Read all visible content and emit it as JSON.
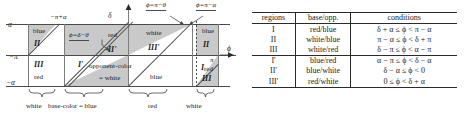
{
  "figure": {
    "type": "diagram-with-table",
    "accent_shade": "#c9c9c9",
    "line_color": "#4a4a4a"
  },
  "diagram": {
    "axes": {
      "y_top": "α",
      "y_mid": "−π",
      "y_bottom": "−α",
      "y_axis_tip": "δ",
      "x_axis_tip": "ϕ",
      "x_right_tick": "π",
      "top_tick": "−π+α"
    },
    "callouts": [
      {
        "name": "phi-delta-theta",
        "text": "ϕ=δ−θ"
      },
      {
        "name": "phi-pi-theta",
        "text": "ϕ=π−θ"
      },
      {
        "name": "phi-pi-alpha",
        "text": "ϕ=π−α"
      }
    ],
    "regions": [
      {
        "name": "region-II-left",
        "label": "II",
        "color_label": "blue"
      },
      {
        "name": "region-III-left",
        "label": "III",
        "color_label": "red"
      },
      {
        "name": "region-I-prime",
        "label": "I'",
        "color_label": ""
      },
      {
        "name": "region-II-prime",
        "label": "II'",
        "color_label": "red"
      },
      {
        "name": "region-III-prime",
        "label": "III'",
        "color_label": "white"
      },
      {
        "name": "region-I-right",
        "label": "I",
        "color_label": "blue"
      },
      {
        "name": "region-II-right",
        "label": "II",
        "color_label": "blue"
      },
      {
        "name": "region-III-right",
        "label": "III",
        "color_label": "red"
      }
    ],
    "inner_labels": {
      "opponent_color": "opponent-color",
      "opponent_color_value": "= white"
    },
    "braces": [
      {
        "name": "brace-white-left",
        "label": "white"
      },
      {
        "name": "brace-base-color",
        "label": "base-color = blue"
      },
      {
        "name": "brace-red",
        "label": "red"
      },
      {
        "name": "brace-white-right",
        "label": "white"
      }
    ]
  },
  "table": {
    "headers": [
      "regions",
      "base/opp.",
      "conditions"
    ],
    "rows": [
      {
        "region": "I",
        "base_opp": "red/blue",
        "condition": "δ + α ≤ ϕ < π − α"
      },
      {
        "region": "II",
        "base_opp": "white/blue",
        "condition": "π − α ≤ ϕ < δ + π"
      },
      {
        "region": "III",
        "base_opp": "white/red",
        "condition": "δ − π ≤ ϕ < α − π"
      },
      {
        "region": "I'",
        "base_opp": "blue/red",
        "condition": "α − π ≤ ϕ < δ − α"
      },
      {
        "region": "II'",
        "base_opp": "blue/white",
        "condition": "δ − α ≤ ϕ < 0"
      },
      {
        "region": "III'",
        "base_opp": "red/white",
        "condition": "0 ≤ ϕ < δ + α"
      }
    ]
  }
}
